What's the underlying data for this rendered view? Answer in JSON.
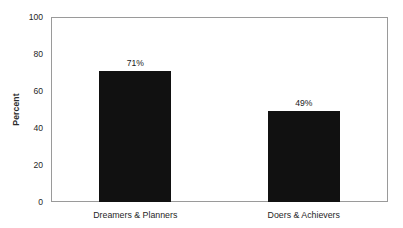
{
  "chart_data": {
    "type": "bar",
    "title": "",
    "xlabel": "",
    "ylabel": "Percent",
    "categories": [
      "Dreamers & Planners",
      "Doers & Achievers"
    ],
    "values": [
      71,
      49
    ],
    "value_labels": [
      "71%",
      "49%"
    ],
    "ylim": [
      0,
      100
    ],
    "yticks": [
      0,
      20,
      40,
      60,
      80,
      100
    ],
    "ytick_labels": [
      "0",
      "20",
      "40",
      "60",
      "80",
      "100"
    ],
    "grid": false,
    "legend": null,
    "bar_color": "#111111",
    "frame_color": "#9a9a9a",
    "background": "#ffffff"
  },
  "figure": {
    "clipped_top_text": ""
  }
}
